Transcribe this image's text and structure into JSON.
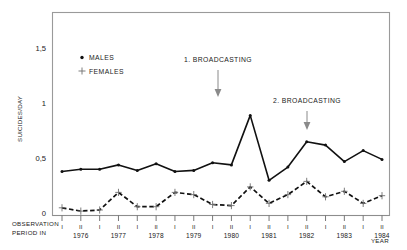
{
  "chart_data": {
    "type": "line",
    "title": "",
    "xlabel": "YEAR",
    "ylabel": "SUICIDES/DAY",
    "ylim": [
      0,
      1.75
    ],
    "yticks": [
      0,
      0.5,
      1,
      1.5
    ],
    "ytick_labels": [
      "0",
      "0,5",
      "1",
      "1,5"
    ],
    "grid": false,
    "legend_position": "upper-left-inside",
    "x_axis_caption_line1": "OBSERVATION",
    "x_axis_caption_line2": "PERIOD IN",
    "categories": [
      "I 1976",
      "II 1976",
      "I 1977",
      "II 1977",
      "I 1978",
      "II 1978",
      "I 1979",
      "II 1979",
      "I 1980",
      "II 1980",
      "I 1981",
      "II 1981",
      "I 1982",
      "II 1982",
      "I 1983",
      "II 1983",
      "I 1984",
      "II 1984"
    ],
    "period_labels": [
      "I",
      "II",
      "I",
      "II",
      "I",
      "II",
      "I",
      "II",
      "I",
      "II",
      "I",
      "II",
      "I",
      "II",
      "I",
      "II",
      "I",
      "II"
    ],
    "years": [
      "1976",
      "1977",
      "1978",
      "1979",
      "1980",
      "1981",
      "1982",
      "1983",
      "1984"
    ],
    "series": [
      {
        "name": "MALES",
        "marker": "dot",
        "linestyle": "solid",
        "values": [
          0.4,
          0.42,
          0.42,
          0.46,
          0.41,
          0.47,
          0.4,
          0.41,
          0.48,
          0.46,
          0.91,
          0.32,
          0.44,
          0.67,
          0.64,
          0.49,
          0.59,
          0.51
        ]
      },
      {
        "name": "FEMALES",
        "marker": "plus",
        "linestyle": "dashed",
        "values": [
          0.07,
          0.04,
          0.05,
          0.21,
          0.08,
          0.08,
          0.21,
          0.19,
          0.1,
          0.09,
          0.26,
          0.11,
          0.19,
          0.31,
          0.17,
          0.22,
          0.11,
          0.18
        ]
      }
    ],
    "annotations": [
      {
        "label": "1. BROADCASTING",
        "at_category": "I 1981",
        "note": "arrow pointing down to the first peak"
      },
      {
        "label": "2. BROADCASTING",
        "at_category": "II 1982",
        "note": "arrow pointing down to the second rise"
      }
    ]
  },
  "legend": {
    "males": "MALES",
    "females": "FEMALES"
  },
  "colors": {
    "series_line": "#111111",
    "frame": "#9a9a9a",
    "annotation_arrow": "#8a8a8a",
    "text": "#1a1a1a",
    "background": "#ffffff"
  }
}
